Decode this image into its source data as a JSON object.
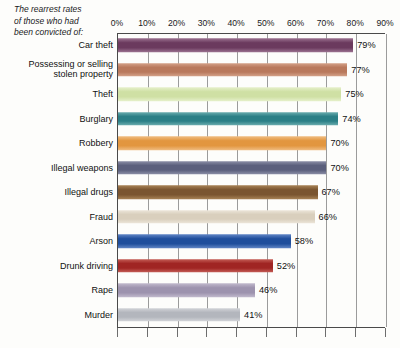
{
  "header": {
    "note_line1": "The rearrest rates",
    "note_line2": "of those who had",
    "note_line3": "been convicted of:"
  },
  "chart_data": {
    "type": "bar",
    "orientation": "horizontal",
    "title": "The rearrest rates of those who had been convicted of:",
    "xlabel": "",
    "ylabel": "",
    "xlim": [
      0,
      90
    ],
    "grid": true,
    "legend": "none",
    "value_suffix": "%",
    "tick_labels": [
      "0%",
      "10%",
      "20%",
      "30%",
      "40%",
      "50%",
      "60%",
      "70%",
      "80%",
      "90%"
    ],
    "tick_values": [
      0,
      10,
      20,
      30,
      40,
      50,
      60,
      70,
      80,
      90
    ],
    "categories": [
      "Car theft",
      "Possessing or selling stolen property",
      "Theft",
      "Burglary",
      "Robbery",
      "Illegal weapons",
      "Illegal drugs",
      "Fraud",
      "Arson",
      "Drunk driving",
      "Rape",
      "Murder"
    ],
    "values": [
      79,
      77,
      75,
      74,
      70,
      70,
      67,
      66,
      58,
      52,
      46,
      41
    ],
    "value_labels": [
      "79%",
      "77%",
      "75%",
      "74%",
      "70%",
      "70%",
      "67%",
      "66%",
      "58%",
      "52%",
      "46%",
      "41%"
    ],
    "colors": [
      "#6b3a5e",
      "#b9795c",
      "#cfe0a4",
      "#2b7f86",
      "#e2963f",
      "#5b5f7c",
      "#7a5530",
      "#d9cfbd",
      "#1f4e9c",
      "#a02523",
      "#9d93ae",
      "#b3b6bd"
    ],
    "color_highlights": [
      "#9c7391",
      "#d4a188",
      "#e6f0cb",
      "#6aacae",
      "#f0bd82",
      "#8b8ea6",
      "#a88356",
      "#ece5d9",
      "#6186c6",
      "#c45d56",
      "#c2bacd",
      "#d2d4d8"
    ],
    "rows": [
      {
        "label": "Car theft",
        "label_line1": "Car theft",
        "label_line2": "",
        "value": 79,
        "value_label": "79%",
        "color": "#6b3a5e",
        "highlight": "#9c7391"
      },
      {
        "label": "Possessing or selling stolen property",
        "label_line1": "Possessing or selling",
        "label_line2": "stolen property",
        "value": 77,
        "value_label": "77%",
        "color": "#b9795c",
        "highlight": "#d4a188"
      },
      {
        "label": "Theft",
        "label_line1": "Theft",
        "label_line2": "",
        "value": 75,
        "value_label": "75%",
        "color": "#cfe0a4",
        "highlight": "#e6f0cb"
      },
      {
        "label": "Burglary",
        "label_line1": "Burglary",
        "label_line2": "",
        "value": 74,
        "value_label": "74%",
        "color": "#2b7f86",
        "highlight": "#6aacae"
      },
      {
        "label": "Robbery",
        "label_line1": "Robbery",
        "label_line2": "",
        "value": 70,
        "value_label": "70%",
        "color": "#e2963f",
        "highlight": "#f0bd82"
      },
      {
        "label": "Illegal weapons",
        "label_line1": "Illegal weapons",
        "label_line2": "",
        "value": 70,
        "value_label": "70%",
        "color": "#5b5f7c",
        "highlight": "#8b8ea6"
      },
      {
        "label": "Illegal drugs",
        "label_line1": "Illegal drugs",
        "label_line2": "",
        "value": 67,
        "value_label": "67%",
        "color": "#7a5530",
        "highlight": "#a88356"
      },
      {
        "label": "Fraud",
        "label_line1": "Fraud",
        "label_line2": "",
        "value": 66,
        "value_label": "66%",
        "color": "#d9cfbd",
        "highlight": "#ece5d9"
      },
      {
        "label": "Arson",
        "label_line1": "Arson",
        "label_line2": "",
        "value": 58,
        "value_label": "58%",
        "color": "#1f4e9c",
        "highlight": "#6186c6"
      },
      {
        "label": "Drunk driving",
        "label_line1": "Drunk driving",
        "label_line2": "",
        "value": 52,
        "value_label": "52%",
        "color": "#a02523",
        "highlight": "#c45d56"
      },
      {
        "label": "Rape",
        "label_line1": "Rape",
        "label_line2": "",
        "value": 46,
        "value_label": "46%",
        "color": "#9d93ae",
        "highlight": "#c2bacd"
      },
      {
        "label": "Murder",
        "label_line1": "Murder",
        "label_line2": "",
        "value": 41,
        "value_label": "41%",
        "color": "#b3b6bd",
        "highlight": "#d2d4d8"
      }
    ]
  }
}
